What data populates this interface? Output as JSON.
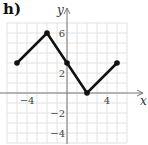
{
  "panel_label": "h)",
  "chart_data": {
    "type": "line",
    "title": "",
    "xlabel": "x",
    "ylabel": "y",
    "x": [
      -5,
      -2,
      0,
      2,
      5
    ],
    "values": [
      3,
      6,
      3,
      0,
      3
    ],
    "series": [
      {
        "name": "piecewise",
        "x": [
          -5,
          -2,
          0,
          2,
          5
        ],
        "y": [
          3,
          6,
          3,
          0,
          3
        ]
      }
    ],
    "xlim": [
      -6,
      6
    ],
    "ylim": [
      -5,
      7
    ],
    "xticks": [
      {
        "value": -4,
        "label": "−4"
      },
      {
        "value": 4,
        "label": "4"
      }
    ],
    "yticks": [
      {
        "value": 6,
        "label": "6"
      },
      {
        "value": 2,
        "label": "2"
      },
      {
        "value": -2,
        "label": "−2"
      },
      {
        "value": -4,
        "label": "−4"
      }
    ],
    "grid": true,
    "legend": null
  }
}
